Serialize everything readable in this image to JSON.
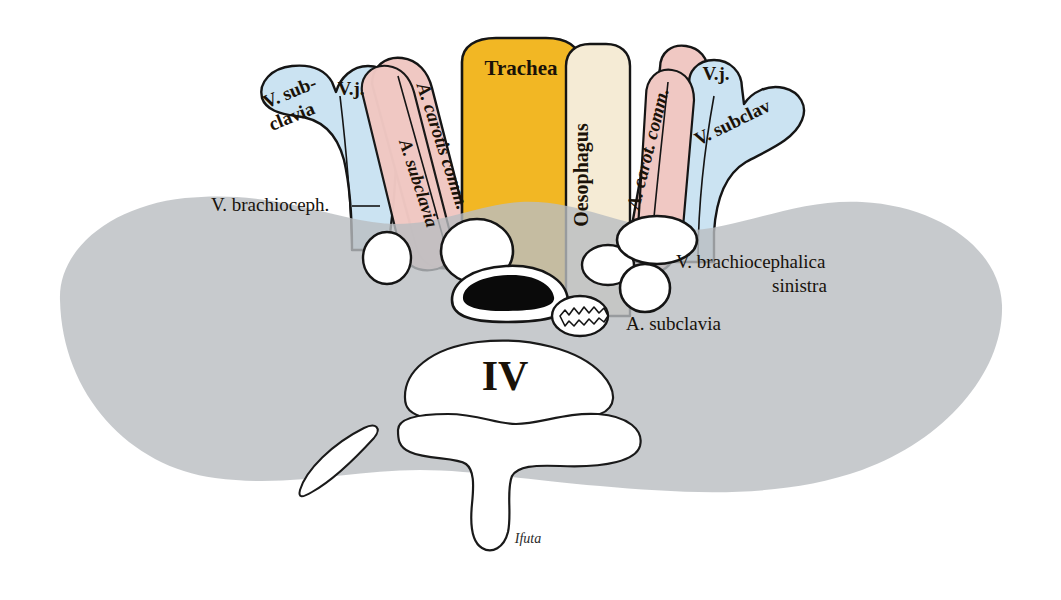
{
  "figure": {
    "background_color": "#ffffff",
    "width": 1061,
    "height": 600
  },
  "palette": {
    "vein_blue": "#CBE3F2",
    "artery_pink": "#F0C8C3",
    "trachea_yellow": "#F2B724",
    "oesophagus_cream": "#F5EBD5",
    "body_gray": "#B9BDC0",
    "lumen_white": "#FFFFFF",
    "lumen_black": "#0A0A0A",
    "ink": "#151515",
    "text": "#17120C"
  },
  "labels": {
    "trachea": "Trachea",
    "oesophagus": "Oesophagus",
    "v_subclavia_left_line1": "V. sub-",
    "v_subclavia_left_line2": "clavia",
    "vj_left": "V.j.",
    "vj_right": "V.j.",
    "a_carotis_comm_left": "A. carotis comm.",
    "a_subclavia_left": "A. subclavia",
    "a_carot_comm_right": "A. carot. comm.",
    "v_subclav_right": "V. subclav",
    "vertebra": "IV",
    "signature": "Ifuta"
  },
  "callouts": [
    {
      "id": "v-brachioceph-left",
      "text": "V. brachioceph.",
      "has_leader_line": true,
      "side": "left"
    },
    {
      "id": "v-brachiocephalica-sinistra",
      "text_line1": "V. brachiocephalica",
      "text_line2": "sinistra",
      "has_leader_line": false,
      "side": "right"
    },
    {
      "id": "a-subclavia-right",
      "text": "A. subclavia",
      "has_leader_line": false,
      "side": "right"
    }
  ],
  "structures": [
    {
      "name": "trachea",
      "color_key": "trachea_yellow",
      "lumen": "black-crescent"
    },
    {
      "name": "oesophagus",
      "color_key": "oesophagus_cream",
      "lumen": "scalloped-oval"
    },
    {
      "name": "left-subclavian-vein",
      "color_key": "vein_blue",
      "lumen": "white-oval"
    },
    {
      "name": "left-internal-jugular-vein",
      "color_key": "vein_blue",
      "lumen": "white-oval"
    },
    {
      "name": "left-common-carotid-artery",
      "color_key": "artery_pink",
      "lumen": "white-oval"
    },
    {
      "name": "left-subclavian-artery",
      "color_key": "artery_pink",
      "lumen": "white-oval"
    },
    {
      "name": "right-common-carotid-artery",
      "color_key": "artery_pink",
      "lumen": "white-oval"
    },
    {
      "name": "right-internal-jugular-vein",
      "color_key": "vein_blue",
      "lumen": "white-oval"
    },
    {
      "name": "right-subclavian-vein",
      "color_key": "vein_blue",
      "lumen": "white-oval"
    },
    {
      "name": "vertebral-body",
      "color_key": "lumen_white",
      "lumen": "none"
    },
    {
      "name": "vertebral-arch",
      "color_key": "lumen_white",
      "lumen": "none"
    },
    {
      "name": "rib-sliver",
      "color_key": "lumen_white",
      "lumen": "none"
    },
    {
      "name": "body-silhouette",
      "color_key": "body_gray",
      "lumen": "none"
    }
  ]
}
